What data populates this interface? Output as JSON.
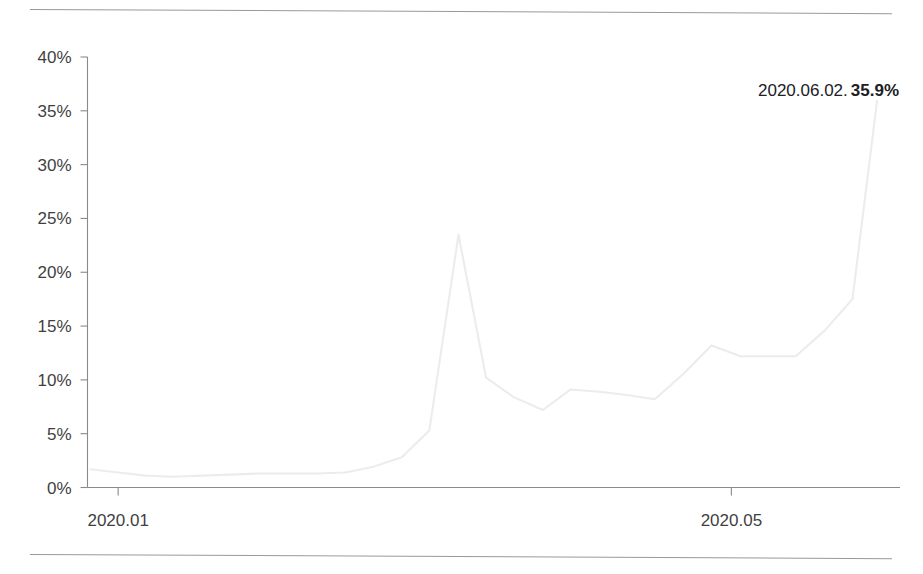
{
  "page": {
    "background_color": "#ffffff",
    "rules": [
      "top-rule",
      "bottom-rule"
    ]
  },
  "annotation": {
    "date": "2020.06.02.",
    "value": "35.9%"
  },
  "chart_data": {
    "type": "line",
    "title": "",
    "subtitle": "",
    "xlabel": "",
    "ylabel": "",
    "grid": false,
    "legend": false,
    "line_color": "#ececed",
    "axis_color": "#8a8a8e",
    "tick_label_color": "#3f3f43",
    "ylim": [
      0,
      40
    ],
    "yticks": [
      0,
      5,
      10,
      15,
      20,
      25,
      30,
      35,
      40
    ],
    "ytick_labels": [
      "0%",
      "5%",
      "10%",
      "15%",
      "20%",
      "25%",
      "30%",
      "35%",
      "40%"
    ],
    "xticks": [
      1,
      5
    ],
    "xtick_labels": [
      "2020.01",
      "2020.05"
    ],
    "xlim": [
      0.8,
      6.1
    ],
    "x": [
      0.82,
      1.0,
      1.18,
      1.36,
      1.55,
      1.73,
      1.92,
      2.1,
      2.3,
      2.48,
      2.66,
      2.85,
      3.03,
      3.22,
      3.4,
      3.58,
      3.77,
      3.95,
      4.14,
      4.32,
      4.5,
      4.69,
      4.87,
      5.06,
      5.24,
      5.42,
      5.61,
      5.79,
      5.95
    ],
    "values": [
      1.7,
      1.4,
      1.1,
      1.0,
      1.1,
      1.2,
      1.3,
      1.3,
      1.3,
      1.4,
      1.9,
      2.8,
      5.3,
      23.5,
      10.2,
      8.4,
      7.2,
      9.1,
      8.9,
      8.6,
      8.2,
      10.6,
      13.2,
      12.2,
      12.2,
      12.2,
      14.6,
      17.5,
      35.9
    ],
    "annotations": [
      {
        "label": "2020.06.02. 35.9%",
        "x": 5.95,
        "y": 35.9
      }
    ],
    "peak": {
      "label": "spike",
      "x": 3.22,
      "y": 23.5
    },
    "endpoint": {
      "label": "2020.06.02.",
      "x": 5.95,
      "y": 35.9
    }
  }
}
